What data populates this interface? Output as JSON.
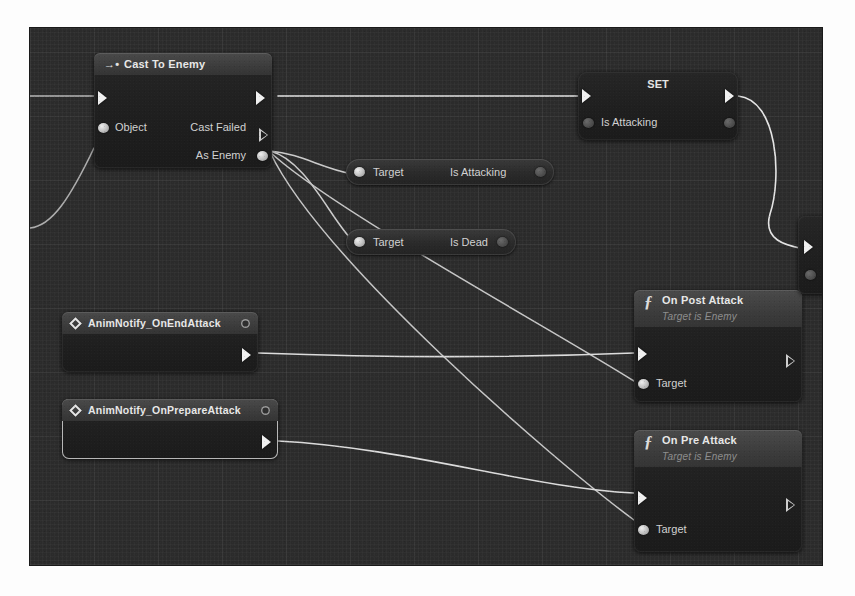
{
  "app": {
    "title": "Blueprint Event Graph",
    "canvas_background": "#2b2b2b"
  },
  "nodes": {
    "cast_to_enemy": {
      "title": "Cast To Enemy",
      "icon": "cast-arrow-icon",
      "exec_in_label": "",
      "exec_out_label": "",
      "input_pins": [
        {
          "label": "Object",
          "type": "object"
        }
      ],
      "output_pins": [
        {
          "label": "Cast Failed",
          "type": "exec"
        },
        {
          "label": "As Enemy",
          "type": "object"
        }
      ]
    },
    "set_is_attacking": {
      "title": "SET",
      "property_label": "Is Attacking"
    },
    "get_is_attacking": {
      "input_label": "Target",
      "output_label": "Is Attacking"
    },
    "get_is_dead": {
      "input_label": "Target",
      "output_label": "Is Dead"
    },
    "anim_notify_on_end_attack": {
      "title": "AnimNotify_OnEndAttack",
      "icon": "event-diamond-icon",
      "selected": false
    },
    "anim_notify_on_prepare_attack": {
      "title": "AnimNotify_OnPrepareAttack",
      "icon": "event-diamond-icon",
      "selected": true
    },
    "on_post_attack": {
      "title": "On Post Attack",
      "subtitle": "Target is Enemy",
      "icon": "function-f-icon",
      "input_pins": [
        {
          "label": "Target",
          "type": "object"
        }
      ]
    },
    "on_pre_attack": {
      "title": "On Pre Attack",
      "subtitle": "Target is Enemy",
      "icon": "function-f-icon",
      "input_pins": [
        {
          "label": "Target",
          "type": "object"
        }
      ]
    },
    "clipped_right_node": {
      "title": ""
    }
  },
  "colors": {
    "exec_wire": "#e8e8e8",
    "data_wire": "#bdbdbd",
    "node_header": "#3f3f3f",
    "node_body": "#212121",
    "text": "#d9d9d9",
    "subtitle_text": "#8e8e8e"
  }
}
